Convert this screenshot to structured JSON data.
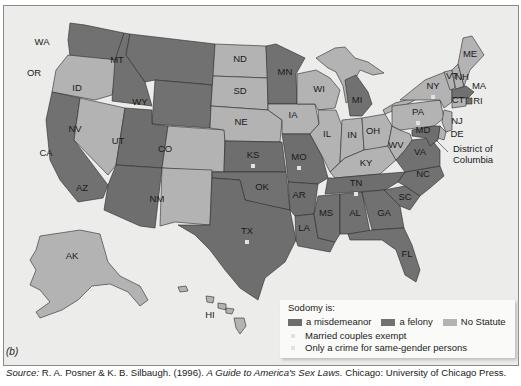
{
  "figure_label": "(b)",
  "colors": {
    "misdemeanor": "#6e6e6e",
    "felony": "#717171",
    "no_statute": "#b3b3b3",
    "water": "#ececea",
    "marker": "#e2e2e2"
  },
  "legend": {
    "title": "Sodomy is:",
    "categories": [
      {
        "key": "misdemeanor",
        "label": "a misdemeanor"
      },
      {
        "key": "felony",
        "label": "a felony"
      },
      {
        "key": "no_statute",
        "label": "No Statute"
      }
    ],
    "notes": [
      {
        "key": "married_exempt",
        "label": "Married couples exempt"
      },
      {
        "key": "same_gender_only",
        "label": "Only a crime for same-gender persons"
      }
    ]
  },
  "dc_label_line1": "District of",
  "dc_label_line2": "Columbia",
  "source": {
    "prefix": "Source:",
    "authors": " R. A. Posner & K. B. Silbaugh. (1996). ",
    "title": "A Guide to America's Sex Laws.",
    "publisher": " Chicago: University of Chicago Press."
  },
  "states": [
    {
      "abbr": "WA",
      "status": "felony",
      "x": 42,
      "y": 45
    },
    {
      "abbr": "OR",
      "status": "no_statute",
      "x": 34,
      "y": 76
    },
    {
      "abbr": "CA",
      "status": "felony",
      "x": 46,
      "y": 156
    },
    {
      "abbr": "NV",
      "status": "no_statute",
      "x": 75,
      "y": 132
    },
    {
      "abbr": "ID",
      "status": "felony",
      "x": 77,
      "y": 91
    },
    {
      "abbr": "MT",
      "status": "felony",
      "x": 117,
      "y": 63
    },
    {
      "abbr": "WY",
      "status": "felony",
      "x": 140,
      "y": 105
    },
    {
      "abbr": "UT",
      "status": "misdemeanor",
      "x": 118,
      "y": 144
    },
    {
      "abbr": "AZ",
      "status": "misdemeanor",
      "x": 82,
      "y": 191
    },
    {
      "abbr": "CO",
      "status": "no_statute",
      "x": 165,
      "y": 152
    },
    {
      "abbr": "NM",
      "status": "no_statute",
      "x": 157,
      "y": 202
    },
    {
      "abbr": "ND",
      "status": "no_statute",
      "x": 240,
      "y": 62
    },
    {
      "abbr": "SD",
      "status": "no_statute",
      "x": 240,
      "y": 94
    },
    {
      "abbr": "NE",
      "status": "no_statute",
      "x": 241,
      "y": 125
    },
    {
      "abbr": "KS",
      "status": "misdemeanor",
      "x": 253,
      "y": 158,
      "marker": "same_gender_only"
    },
    {
      "abbr": "OK",
      "status": "felony",
      "x": 262,
      "y": 190
    },
    {
      "abbr": "TX",
      "status": "misdemeanor",
      "x": 247,
      "y": 234,
      "marker": "same_gender_only"
    },
    {
      "abbr": "MN",
      "status": "felony",
      "x": 285,
      "y": 75
    },
    {
      "abbr": "IA",
      "status": "no_statute",
      "x": 293,
      "y": 118
    },
    {
      "abbr": "MO",
      "status": "misdemeanor",
      "x": 299,
      "y": 160,
      "marker": "same_gender_only"
    },
    {
      "abbr": "AR",
      "status": "misdemeanor",
      "x": 299,
      "y": 198
    },
    {
      "abbr": "LA",
      "status": "felony",
      "x": 304,
      "y": 231
    },
    {
      "abbr": "WI",
      "status": "no_statute",
      "x": 319,
      "y": 92
    },
    {
      "abbr": "IL",
      "status": "no_statute",
      "x": 327,
      "y": 137
    },
    {
      "abbr": "MI",
      "status": "felony",
      "x": 357,
      "y": 103
    },
    {
      "abbr": "IN",
      "status": "no_statute",
      "x": 352,
      "y": 138
    },
    {
      "abbr": "OH",
      "status": "no_statute",
      "x": 373,
      "y": 134
    },
    {
      "abbr": "KY",
      "status": "no_statute",
      "x": 366,
      "y": 166
    },
    {
      "abbr": "TN",
      "status": "misdemeanor",
      "x": 356,
      "y": 186,
      "marker": "same_gender_only"
    },
    {
      "abbr": "MS",
      "status": "felony",
      "x": 326,
      "y": 216
    },
    {
      "abbr": "AL",
      "status": "felony",
      "x": 355,
      "y": 216
    },
    {
      "abbr": "GA",
      "status": "felony",
      "x": 384,
      "y": 216
    },
    {
      "abbr": "FL",
      "status": "felony",
      "x": 407,
      "y": 257
    },
    {
      "abbr": "SC",
      "status": "felony",
      "x": 405,
      "y": 200
    },
    {
      "abbr": "NC",
      "status": "felony",
      "x": 423,
      "y": 177
    },
    {
      "abbr": "VA",
      "status": "felony",
      "x": 420,
      "y": 155
    },
    {
      "abbr": "WV",
      "status": "no_statute",
      "x": 396,
      "y": 148
    },
    {
      "abbr": "PA",
      "status": "no_statute",
      "x": 418,
      "y": 115,
      "marker": "married_exempt"
    },
    {
      "abbr": "NY",
      "status": "no_statute",
      "x": 433,
      "y": 89,
      "marker": "married_exempt"
    },
    {
      "abbr": "VT",
      "status": "no_statute",
      "x": 452,
      "y": 79
    },
    {
      "abbr": "NH",
      "status": "no_statute",
      "x": 462,
      "y": 80
    },
    {
      "abbr": "ME",
      "status": "no_statute",
      "x": 470,
      "y": 57
    },
    {
      "abbr": "MA",
      "status": "felony",
      "x": 479,
      "y": 89
    },
    {
      "abbr": "RI",
      "status": "felony",
      "x": 478,
      "y": 104
    },
    {
      "abbr": "CT",
      "status": "no_statute",
      "x": 458,
      "y": 103
    },
    {
      "abbr": "NJ",
      "status": "no_statute",
      "x": 457,
      "y": 124
    },
    {
      "abbr": "DE",
      "status": "no_statute",
      "x": 457,
      "y": 137
    },
    {
      "abbr": "MD",
      "status": "misdemeanor",
      "x": 423,
      "y": 133
    },
    {
      "abbr": "AK",
      "status": "no_statute",
      "x": 72,
      "y": 259
    },
    {
      "abbr": "HI",
      "status": "no_statute",
      "x": 210,
      "y": 318
    }
  ]
}
